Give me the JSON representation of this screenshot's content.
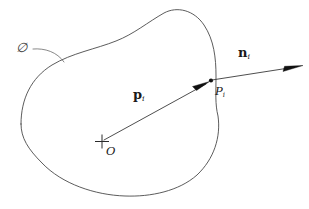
{
  "figure": {
    "background_color": "#ffffff",
    "stroke_color": "#4a4a4a",
    "vector_color": "#3a3a3a",
    "text_color": "#1a1a1a",
    "width": 309,
    "height": 209
  },
  "labels": {
    "surface": {
      "text": "∅",
      "name": "script-O",
      "description": "script letter O denoting the object surface"
    },
    "position_vector": {
      "symbol": "p",
      "subscript": "i"
    },
    "normal_vector": {
      "symbol": "n",
      "subscript": "i"
    },
    "boundary_point": {
      "symbol": "P",
      "subscript": "i"
    },
    "origin": {
      "symbol": "O"
    }
  },
  "geometry": {
    "origin_marker": {
      "x": 101,
      "y": 142
    },
    "boundary_point": {
      "x": 211,
      "y": 81
    },
    "normal_arrow_tip": {
      "x": 303,
      "y": 66
    },
    "p_arrow_tip": {
      "x": 208,
      "y": 83
    },
    "blob_path": "M 21,124 C 21,95 36,72 62,60 C 86,49 112,44 133,32 C 150,22 163,11 180,12 C 200,13 213,30 216,52 C 219,72 215,94 218,112 C 221,134 216,156 200,172 C 180,192 150,197 124,196 C 92,195 60,183 41,163 C 27,148 21,137 21,124 Z",
    "leader_path": "M 33,48 C 48,48 59,53 66,61",
    "p_vector_path": "M 103,141 L 208,83",
    "n_vector_path": "M 211,81 L 299,67"
  }
}
